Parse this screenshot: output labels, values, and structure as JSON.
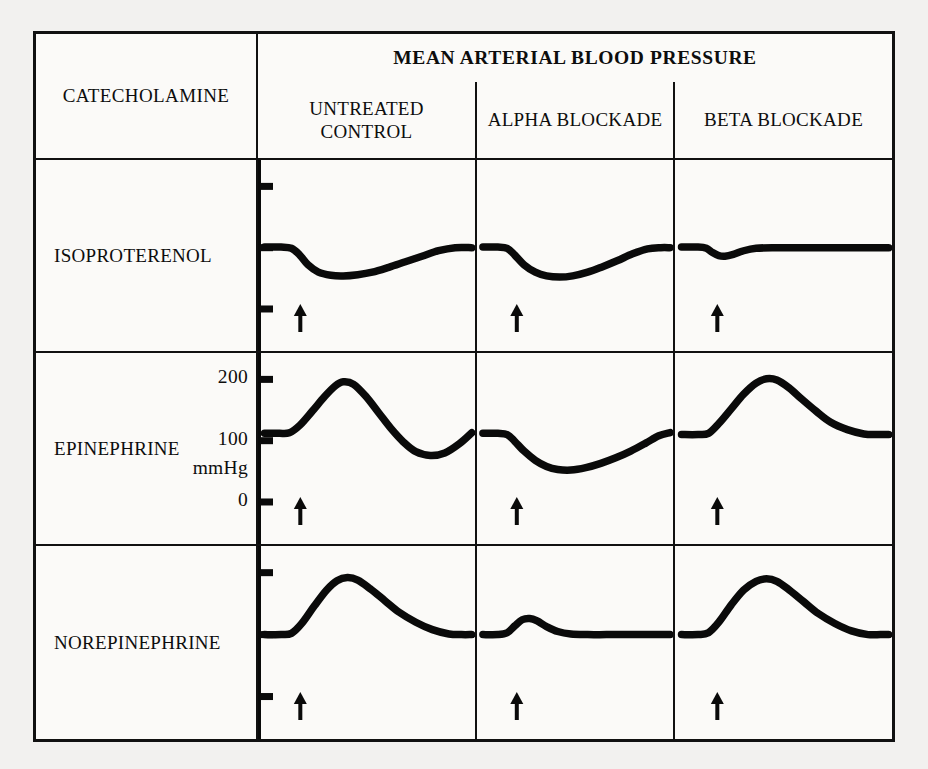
{
  "figure": {
    "header_span": "MEAN ARTERIAL BLOOD PRESSURE",
    "corner_label": "CATECHOLAMINE",
    "columns": [
      "UNTREATED CONTROL",
      "ALPHA BLOCKADE",
      "BETA BLOCKADE"
    ],
    "rows": [
      "ISOPROTERENOL",
      "EPINEPHRINE",
      "NOREPINEPHRINE"
    ],
    "axis_labels": {
      "top": "200",
      "mid": "100",
      "unit": "mmHg",
      "zero": "0"
    },
    "injection_marker": "arrow-up"
  },
  "chart_data": {
    "type": "line",
    "title": "MEAN ARTERIAL BLOOD PRESSURE",
    "ylabel": "mmHg",
    "xlabel": "",
    "ylim": [
      0,
      215
    ],
    "yticks": [
      0,
      100,
      200
    ],
    "ytick_labels": [
      "0",
      "100",
      "200"
    ],
    "grid": false,
    "legend": "none",
    "x_units": "time (arbitrary, ~1 min full width)",
    "annotation": "arrow marks intravenous injection of the catecholamine",
    "row_variable": "catecholamine",
    "column_variable": "pretreatment",
    "categories": [
      "UNTREATED CONTROL",
      "ALPHA BLOCKADE",
      "BETA BLOCKADE"
    ],
    "panels": [
      {
        "row": "ISOPROTERENOL",
        "column": "UNTREATED CONTROL",
        "baseline": 100,
        "peak": 55,
        "response": "depressor",
        "injection_x": 12,
        "x": [
          0,
          8,
          13,
          17,
          21,
          26,
          32,
          38,
          45,
          52,
          60,
          68,
          76,
          84,
          92,
          100
        ],
        "y": [
          101,
          101,
          99,
          88,
          72,
          60,
          55,
          54,
          56,
          60,
          68,
          77,
          86,
          95,
          100,
          100
        ]
      },
      {
        "row": "ISOPROTERENOL",
        "column": "ALPHA BLOCKADE",
        "baseline": 100,
        "peak": 52,
        "response": "depressor",
        "injection_x": 12,
        "x": [
          0,
          8,
          13,
          17,
          22,
          28,
          34,
          41,
          48,
          56,
          64,
          72,
          80,
          88,
          95,
          100
        ],
        "y": [
          101,
          101,
          99,
          88,
          72,
          60,
          54,
          52,
          54,
          60,
          69,
          79,
          90,
          98,
          100,
          100
        ]
      },
      {
        "row": "ISOPROTERENOL",
        "column": "BETA BLOCKADE",
        "baseline": 100,
        "peak": 86,
        "response": "abolished",
        "injection_x": 12,
        "x": [
          0,
          8,
          12,
          15,
          18,
          21,
          25,
          30,
          36,
          45,
          58,
          72,
          86,
          100
        ],
        "y": [
          101,
          101,
          99,
          92,
          87,
          86,
          89,
          95,
          99,
          100,
          100,
          100,
          100,
          100
        ]
      },
      {
        "row": "EPINEPHRINE",
        "column": "UNTREATED CONTROL",
        "baseline": 112,
        "peak": 196,
        "undershoot": 76,
        "response": "pressor with post-pressor fall",
        "injection_x": 12,
        "x": [
          0,
          7,
          12,
          17,
          23,
          29,
          34,
          38,
          43,
          49,
          55,
          61,
          67,
          73,
          80,
          87,
          94,
          100
        ],
        "y": [
          112,
          112,
          113,
          125,
          148,
          172,
          189,
          196,
          192,
          172,
          146,
          120,
          98,
          82,
          76,
          80,
          95,
          113
        ]
      },
      {
        "row": "EPINEPHRINE",
        "column": "ALPHA BLOCKADE",
        "baseline": 112,
        "peak": 52,
        "response": "epinephrine reversal (depressor)",
        "injection_x": 12,
        "x": [
          0,
          8,
          13,
          17,
          22,
          28,
          34,
          40,
          47,
          55,
          63,
          71,
          79,
          87,
          94,
          100
        ],
        "y": [
          112,
          112,
          110,
          99,
          83,
          68,
          58,
          53,
          52,
          56,
          63,
          72,
          83,
          96,
          108,
          113
        ]
      },
      {
        "row": "EPINEPHRINE",
        "column": "BETA BLOCKADE",
        "baseline": 110,
        "peak": 201,
        "response": "enhanced pressor, no undershoot",
        "injection_x": 12,
        "x": [
          0,
          8,
          13,
          18,
          24,
          30,
          36,
          41,
          46,
          52,
          58,
          65,
          72,
          80,
          88,
          94,
          100
        ],
        "y": [
          110,
          110,
          112,
          128,
          152,
          176,
          194,
          201,
          199,
          186,
          168,
          148,
          130,
          118,
          111,
          110,
          110
        ]
      },
      {
        "row": "NOREPINEPHRINE",
        "column": "UNTREATED CONTROL",
        "baseline": 100,
        "peak": 192,
        "response": "pressor",
        "injection_x": 12,
        "x": [
          0,
          8,
          13,
          18,
          24,
          30,
          35,
          40,
          45,
          51,
          58,
          65,
          73,
          81,
          89,
          95,
          100
        ],
        "y": [
          100,
          100,
          102,
          118,
          146,
          172,
          187,
          192,
          188,
          174,
          155,
          136,
          120,
          108,
          101,
          100,
          100
        ]
      },
      {
        "row": "NOREPINEPHRINE",
        "column": "ALPHA BLOCKADE",
        "baseline": 100,
        "peak": 126,
        "response": "greatly blunted pressor",
        "injection_x": 12,
        "x": [
          0,
          8,
          13,
          17,
          21,
          25,
          29,
          34,
          40,
          47,
          56,
          66,
          78,
          90,
          100
        ],
        "y": [
          100,
          100,
          103,
          114,
          124,
          126,
          122,
          113,
          105,
          101,
          100,
          100,
          100,
          100,
          100
        ]
      },
      {
        "row": "NOREPINEPHRINE",
        "column": "BETA BLOCKADE",
        "baseline": 100,
        "peak": 190,
        "response": "pressor preserved",
        "injection_x": 12,
        "x": [
          0,
          8,
          13,
          18,
          24,
          30,
          36,
          41,
          46,
          52,
          59,
          66,
          74,
          82,
          90,
          96,
          100
        ],
        "y": [
          100,
          100,
          103,
          120,
          148,
          172,
          186,
          190,
          186,
          172,
          153,
          134,
          118,
          106,
          100,
          100,
          100
        ]
      }
    ]
  }
}
